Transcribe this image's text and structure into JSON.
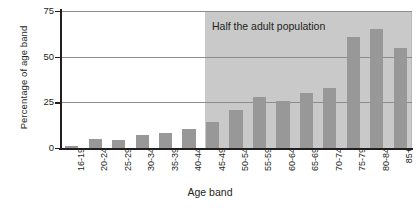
{
  "chart_data": {
    "type": "bar",
    "title": "",
    "xlabel": "Age band",
    "ylabel": "Percentage of age band",
    "categories": [
      "16-19",
      "20-24",
      "25-29",
      "30-34",
      "35-39",
      "40-44",
      "45-49",
      "50-54",
      "55-59",
      "60-64",
      "65-69",
      "70-74",
      "75-79",
      "80-84",
      "85+"
    ],
    "values": [
      1,
      5,
      4.5,
      7,
      8,
      10.5,
      14,
      21,
      28,
      26,
      30,
      33,
      61,
      65,
      55
    ],
    "ylim": [
      0,
      75
    ],
    "yticks": [
      0,
      25,
      50,
      75
    ],
    "ytick_labels": [
      "0",
      "25",
      "50",
      "75"
    ],
    "grid": true,
    "legend": "none",
    "annotations": [
      {
        "text": "Half the adult population",
        "start_category": "45-49",
        "end_category": "85+"
      }
    ],
    "colors": {
      "bar": "#989898",
      "shaded_region": "#c9c9c9",
      "axis": "#231f20",
      "gridline": "#8d8d8d",
      "background": "#ffffff"
    }
  }
}
